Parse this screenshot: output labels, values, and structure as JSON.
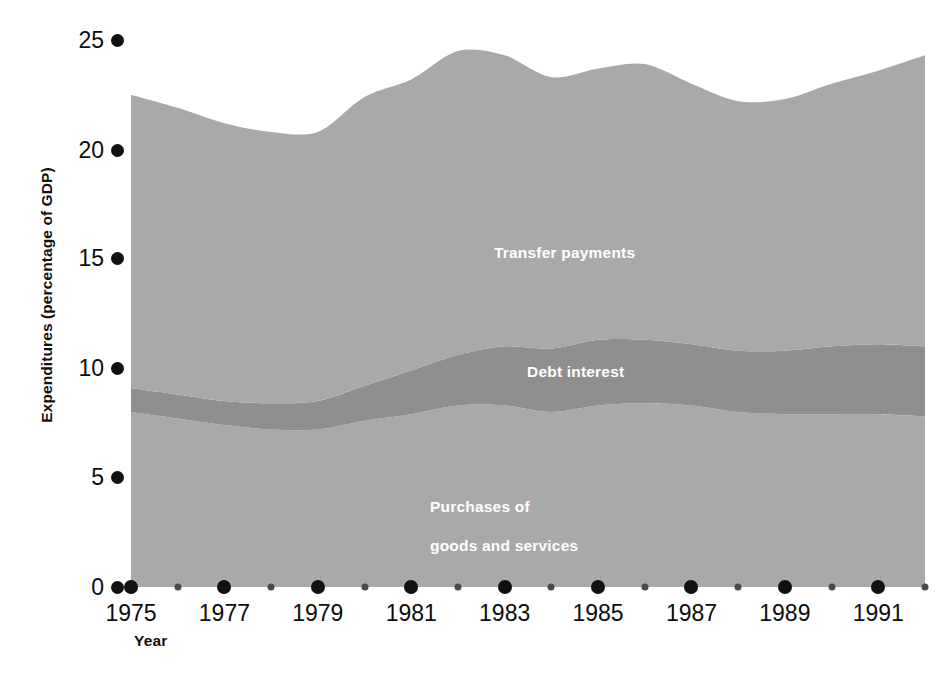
{
  "chart_data": {
    "type": "area",
    "subtype": "stacked-area",
    "title": "",
    "xlabel": "Year",
    "ylabel": "Expenditures (percentage of GDP)",
    "xlim": [
      1975,
      1992
    ],
    "ylim": [
      0,
      25
    ],
    "grid": false,
    "legend_position": "inline-labels",
    "y_ticks": [
      0,
      5,
      10,
      15,
      20,
      25
    ],
    "y_tick_labels": [
      "0",
      "5",
      "10",
      "15",
      "20",
      "25"
    ],
    "x_ticks_major": [
      1975,
      1977,
      1979,
      1981,
      1983,
      1985,
      1987,
      1989,
      1991
    ],
    "x_tick_labels": [
      "1975",
      "1977",
      "1979",
      "1981",
      "1983",
      "1985",
      "1987",
      "1989",
      "1991"
    ],
    "x_ticks_minor": [
      1976,
      1978,
      1980,
      1982,
      1984,
      1986,
      1988,
      1990,
      1992
    ],
    "x": [
      1975,
      1976,
      1977,
      1978,
      1979,
      1980,
      1981,
      1982,
      1983,
      1984,
      1985,
      1986,
      1987,
      1988,
      1989,
      1990,
      1991,
      1992
    ],
    "series": [
      {
        "name": "Purchases of goods and services",
        "label": "Purchases of\ngoods and services",
        "color": "#a9a9a9",
        "values": [
          8.0,
          7.7,
          7.4,
          7.2,
          7.2,
          7.6,
          7.9,
          8.3,
          8.3,
          8.0,
          8.3,
          8.4,
          8.3,
          8.0,
          7.9,
          7.9,
          7.9,
          7.8
        ]
      },
      {
        "name": "Debt interest",
        "label": "Debt interest",
        "color": "#8f8f8f",
        "values": [
          1.1,
          1.1,
          1.1,
          1.2,
          1.3,
          1.6,
          2.0,
          2.3,
          2.7,
          2.9,
          3.0,
          2.9,
          2.8,
          2.8,
          2.9,
          3.1,
          3.2,
          3.2
        ]
      },
      {
        "name": "Transfer payments",
        "label": "Transfer payments",
        "color": "#a9a9a9",
        "values": [
          13.4,
          13.1,
          12.7,
          12.4,
          12.3,
          13.2,
          13.3,
          13.9,
          13.3,
          12.4,
          12.4,
          12.6,
          11.9,
          11.4,
          11.5,
          12.0,
          12.5,
          13.3
        ]
      }
    ],
    "stack_totals": [
      22.5,
      21.9,
      21.2,
      20.8,
      20.8,
      22.4,
      23.2,
      24.5,
      24.3,
      23.3,
      23.7,
      23.9,
      23.0,
      22.2,
      22.3,
      23.0,
      23.6,
      24.3
    ]
  },
  "axis": {
    "y_title": "Expenditures (percentage of GDP)",
    "x_title": "Year"
  },
  "labels": {
    "transfer": "Transfer payments",
    "debt": "Debt interest",
    "purchases_line1": "Purchases of",
    "purchases_line2": "goods and services"
  },
  "colors": {
    "band_light": "#a9a9a9",
    "band_dark": "#8f8f8f",
    "tick": "#111111",
    "text": "#0d0d0d",
    "label_text": "#ffffff",
    "background": "#ffffff"
  }
}
